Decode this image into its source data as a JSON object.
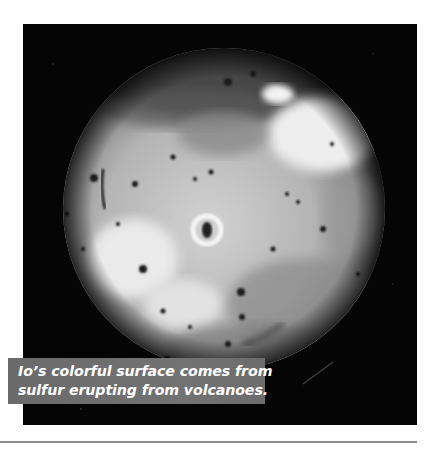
{
  "figure": {
    "image_alt": "Grayscale photograph of Io showing a mottled volcanic surface with dark spots",
    "caption": {
      "lines": [
        "Io’s colorful surface comes from",
        "sulfur erupting from volcanoes."
      ]
    }
  },
  "colors": {
    "photo_background": "#050505",
    "caption_background": "#6e6e6e",
    "caption_text": "#ffffff",
    "rule": "#8a8a8a"
  }
}
